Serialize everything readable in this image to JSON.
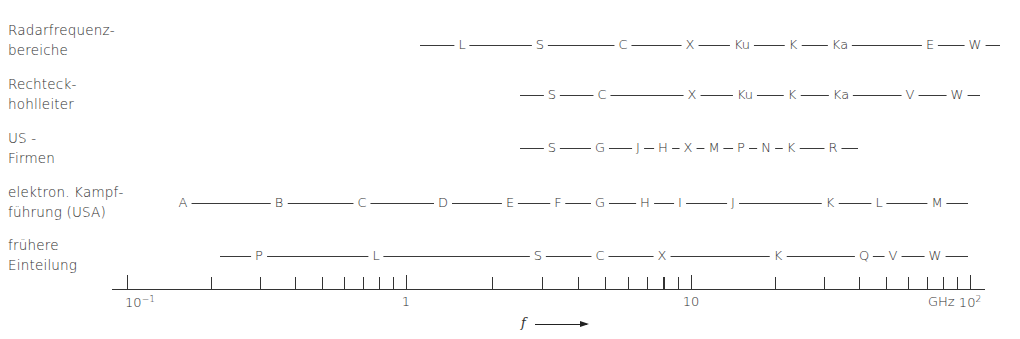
{
  "chart_data": {
    "type": "diagram",
    "title": "",
    "xlabel": "f",
    "x_unit": "GHz",
    "x_scale": "log",
    "xlim": [
      0.1,
      100
    ],
    "tick_labels": [
      "10^-1",
      "1",
      "10",
      "GHz 10^2"
    ],
    "rows": [
      {
        "name": "Radarfrequenzbereiche",
        "bands": [
          "L",
          "S",
          "C",
          "X",
          "Ku",
          "K",
          "Ka",
          "E",
          "W"
        ]
      },
      {
        "name": "Rechteckhohlleiter",
        "bands": [
          "S",
          "C",
          "X",
          "Ku",
          "K",
          "Ka",
          "V",
          "W"
        ]
      },
      {
        "name": "US-Firmen",
        "bands": [
          "S",
          "G",
          "J",
          "H",
          "X",
          "M",
          "P",
          "N",
          "K",
          "R"
        ]
      },
      {
        "name": "elektron. Kampfführung (USA)",
        "bands": [
          "A",
          "B",
          "C",
          "D",
          "E",
          "F",
          "G",
          "H",
          "I",
          "J",
          "K",
          "L",
          "M"
        ]
      },
      {
        "name": "frühere Einteilung",
        "bands": [
          "P",
          "L",
          "S",
          "C",
          "X",
          "K",
          "Q",
          "V",
          "W"
        ]
      }
    ]
  },
  "rows": [
    {
      "label_lines": [
        "Radarfrequenz-",
        "bereiche"
      ],
      "y": 45,
      "label_top": 20,
      "line": [
        420,
        1000
      ],
      "bands": [
        {
          "t": "L",
          "x": 462
        },
        {
          "t": "S",
          "x": 540
        },
        {
          "t": "C",
          "x": 623
        },
        {
          "t": "X",
          "x": 690
        },
        {
          "t": "Ku",
          "x": 742
        },
        {
          "t": "K",
          "x": 793
        },
        {
          "t": "Ka",
          "x": 840
        },
        {
          "t": "E",
          "x": 930
        },
        {
          "t": "W",
          "x": 975
        }
      ]
    },
    {
      "label_lines": [
        "Rechteck-",
        "hohlleiter"
      ],
      "y": 95,
      "label_top": 74,
      "line": [
        520,
        980
      ],
      "bands": [
        {
          "t": "S",
          "x": 552
        },
        {
          "t": "C",
          "x": 602
        },
        {
          "t": "X",
          "x": 692
        },
        {
          "t": "Ku",
          "x": 745
        },
        {
          "t": "K",
          "x": 792
        },
        {
          "t": "Ka",
          "x": 841
        },
        {
          "t": "V",
          "x": 910
        },
        {
          "t": "W",
          "x": 957
        }
      ]
    },
    {
      "label_lines": [
        "US -",
        "Firmen"
      ],
      "y": 148,
      "label_top": 128,
      "line": [
        520,
        858
      ],
      "bands": [
        {
          "t": "S",
          "x": 552
        },
        {
          "t": "G",
          "x": 600
        },
        {
          "t": "J",
          "x": 638
        },
        {
          "t": "H",
          "x": 663
        },
        {
          "t": "X",
          "x": 688
        },
        {
          "t": "M",
          "x": 714
        },
        {
          "t": "P",
          "x": 741
        },
        {
          "t": "N",
          "x": 766
        },
        {
          "t": "K",
          "x": 791
        },
        {
          "t": "R",
          "x": 833
        }
      ]
    },
    {
      "label_lines": [
        "elektron. Kampf-",
        "führung (USA)"
      ],
      "y": 203,
      "label_top": 182,
      "line": [
        183,
        968
      ],
      "bands": [
        {
          "t": "A",
          "x": 183
        },
        {
          "t": "B",
          "x": 279
        },
        {
          "t": "C",
          "x": 362
        },
        {
          "t": "D",
          "x": 443
        },
        {
          "t": "E",
          "x": 510
        },
        {
          "t": "F",
          "x": 558
        },
        {
          "t": "G",
          "x": 600
        },
        {
          "t": "H",
          "x": 645
        },
        {
          "t": "I",
          "x": 680
        },
        {
          "t": "J",
          "x": 733
        },
        {
          "t": "K",
          "x": 830
        },
        {
          "t": "L",
          "x": 879
        },
        {
          "t": "M",
          "x": 937
        }
      ]
    },
    {
      "label_lines": [
        "frühere",
        "Einteilung"
      ],
      "y": 256,
      "label_top": 235,
      "line": [
        220,
        968
      ],
      "bands": [
        {
          "t": "P",
          "x": 259
        },
        {
          "t": "L",
          "x": 376
        },
        {
          "t": "S",
          "x": 538
        },
        {
          "t": "C",
          "x": 600
        },
        {
          "t": "X",
          "x": 662
        },
        {
          "t": "K",
          "x": 778
        },
        {
          "t": "Q",
          "x": 864
        },
        {
          "t": "V",
          "x": 893
        },
        {
          "t": "W",
          "x": 935
        }
      ]
    }
  ],
  "axis": {
    "y": 289,
    "x_start": 112,
    "x_end": 985,
    "decade_px": [
      127,
      406,
      691,
      970
    ],
    "major_labels": [
      {
        "base": "10",
        "exp": "−1",
        "x": 140
      },
      {
        "base": "1",
        "exp": "",
        "x": 406
      },
      {
        "base": "10",
        "exp": "",
        "x": 691
      },
      {
        "base": "10",
        "exp": "2",
        "x": 970
      }
    ],
    "unit": "GHz",
    "unit_x": 928
  },
  "frequency_label": "f"
}
